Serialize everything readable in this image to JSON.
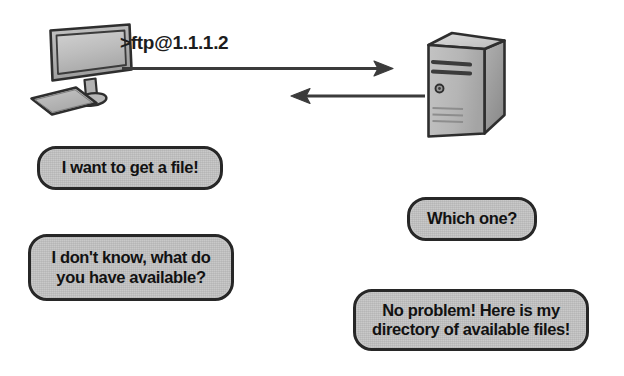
{
  "figure": {
    "type": "network-protocol-illustration",
    "background_color": "#ffffff",
    "ink_color": "#272727",
    "bubble_fill_color": "#c9c9c9"
  },
  "nodes": {
    "client": {
      "icon_name": "desktop-computer-icon",
      "label": "client workstation"
    },
    "server": {
      "icon_name": "server-tower-icon",
      "label": "ftp server"
    }
  },
  "command": {
    "text": ">ftp@1.1.1.2"
  },
  "arrows": [
    {
      "name": "request-arrow",
      "direction": "right",
      "from": "client",
      "to": "server"
    },
    {
      "name": "response-arrow",
      "direction": "left",
      "from": "server",
      "to": "client"
    }
  ],
  "bubbles": {
    "client_first": {
      "text": "I want to get a file!"
    },
    "client_second": {
      "line1": "I don't know, what do",
      "line2": "you have available?"
    },
    "server_first": {
      "text": "Which one?"
    },
    "server_second": {
      "line1": "No problem! Here is my",
      "line2": "directory of available files!"
    }
  }
}
